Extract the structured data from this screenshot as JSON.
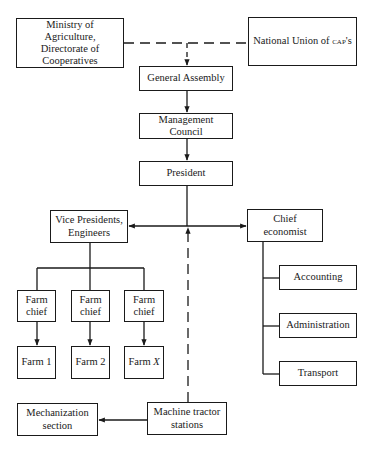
{
  "diagram": {
    "type": "organizational-chart",
    "nodes": {
      "ministry": {
        "line1": "Ministry of Agriculture,",
        "line2": "Directorate of",
        "line3": "Cooperatives"
      },
      "union": {
        "prefix": "National Union of ",
        "abbr": "CAP",
        "suffix": "'s"
      },
      "general_assembly": {
        "label": "General Assembly"
      },
      "management_council": {
        "label": "Management Council"
      },
      "president": {
        "label": "President"
      },
      "vice_presidents": {
        "line1": "Vice Presidents,",
        "line2": "Engineers"
      },
      "chief_economist": {
        "label": "Chief economist"
      },
      "accounting": {
        "label": "Accounting"
      },
      "administration": {
        "label": "Administration"
      },
      "transport": {
        "label": "Transport"
      },
      "farm_chief_1": {
        "line1": "Farm",
        "line2": "chief"
      },
      "farm_chief_2": {
        "line1": "Farm",
        "line2": "chief"
      },
      "farm_chief_3": {
        "line1": "Farm",
        "line2": "chief"
      },
      "farm_1": {
        "label": "Farm 1"
      },
      "farm_2": {
        "label": "Farm 2"
      },
      "farm_x": {
        "prefix": "Farm ",
        "var": "X"
      },
      "mechanization": {
        "line1": "Mechanization",
        "line2": "section"
      },
      "mts": {
        "line1": "Machine tractor",
        "line2": "stations"
      }
    },
    "edges": [
      {
        "from": "Ministry of Agriculture, Directorate of Cooperatives",
        "to": "National Union of CAP's",
        "style": "dashed"
      },
      {
        "from": "Ministry/National Union link",
        "to": "General Assembly",
        "style": "dashed-arrow"
      },
      {
        "from": "General Assembly",
        "to": "Management Council",
        "style": "solid-arrow"
      },
      {
        "from": "Management Council",
        "to": "President",
        "style": "solid-arrow"
      },
      {
        "from": "President",
        "to": "Vice Presidents, Engineers",
        "style": "solid-arrow"
      },
      {
        "from": "President",
        "to": "Chief economist",
        "style": "solid-arrow"
      },
      {
        "from": "Machine tractor stations",
        "to": "President line",
        "style": "dashed-arrow"
      },
      {
        "from": "Vice Presidents, Engineers",
        "to": "Farm chief (x3)",
        "style": "solid"
      },
      {
        "from": "Farm chief",
        "to": "Farm 1",
        "style": "solid-arrow"
      },
      {
        "from": "Farm chief",
        "to": "Farm 2",
        "style": "solid-arrow"
      },
      {
        "from": "Farm chief",
        "to": "Farm X",
        "style": "solid-arrow"
      },
      {
        "from": "Chief economist",
        "to": "Accounting",
        "style": "solid"
      },
      {
        "from": "Chief economist",
        "to": "Administration",
        "style": "solid"
      },
      {
        "from": "Chief economist",
        "to": "Transport",
        "style": "solid"
      },
      {
        "from": "Machine tractor stations",
        "to": "Mechanization section",
        "style": "solid-arrow"
      }
    ],
    "colors": {
      "line": "#1a1a1a",
      "background": "#ffffff"
    }
  }
}
